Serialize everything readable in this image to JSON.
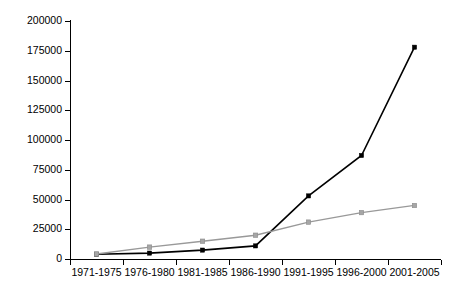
{
  "chart_data": {
    "type": "line",
    "title": "",
    "subtitle": "",
    "xlabel": "",
    "ylabel": "",
    "categories": [
      "1971-1975",
      "1976-1980",
      "1981-1985",
      "1986-1990",
      "1991-1995",
      "1996-2000",
      "2001-2005"
    ],
    "series": [
      {
        "name": "series-1",
        "color": "#000000",
        "marker": "square",
        "values": [
          4000,
          5000,
          7500,
          11000,
          53000,
          87000,
          178000
        ]
      },
      {
        "name": "series-2",
        "color": "#999999",
        "marker": "square",
        "values": [
          4200,
          10000,
          15000,
          20000,
          31000,
          39000,
          45000
        ]
      }
    ],
    "ylim": [
      0,
      200000
    ],
    "yticks": [
      0,
      25000,
      50000,
      75000,
      100000,
      125000,
      150000,
      175000,
      200000
    ],
    "ytick_labels": [
      "0",
      "25000",
      "50000",
      "75000",
      "100000",
      "125000",
      "150000",
      "175000",
      "200000"
    ],
    "grid": false,
    "legend": false,
    "legend_position": "none",
    "annotations": []
  },
  "axes": {
    "y_tick_labels": [
      "200000",
      "175000",
      "150000",
      "125000",
      "100000",
      "75000",
      "50000",
      "25000",
      "0"
    ],
    "x_tick_labels": [
      "1971-1975",
      "1976-1980",
      "1981-1985",
      "1986-1990",
      "1991-1995",
      "1996-2000",
      "2001-2005"
    ]
  },
  "colors": {
    "series_1": "#000000",
    "series_2": "#999999",
    "axis": "#000000",
    "background": "#ffffff"
  }
}
